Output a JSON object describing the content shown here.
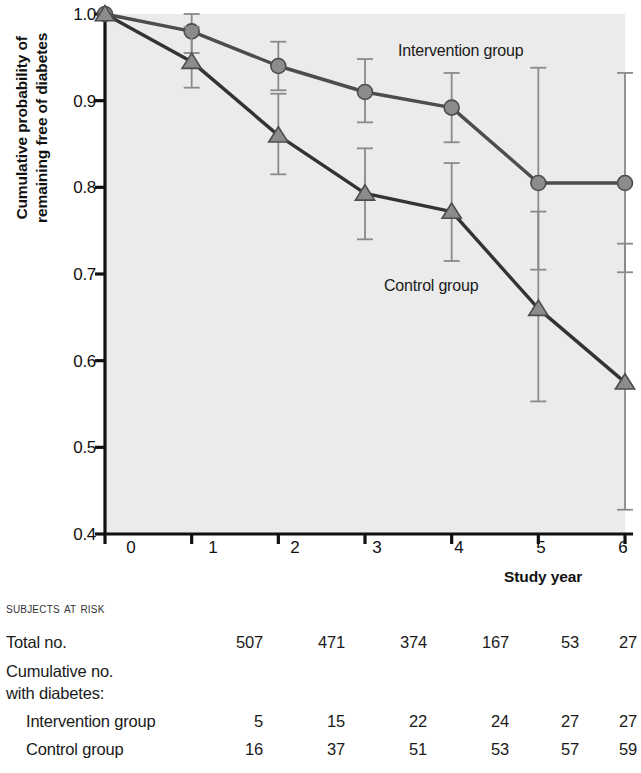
{
  "chart_data": {
    "type": "line",
    "title": "",
    "xlabel": "Study year",
    "ylabel": "Cumulative probability of remaining free of diabetes",
    "x": [
      0,
      1,
      2,
      3,
      4,
      5,
      6
    ],
    "xlim": [
      0,
      6
    ],
    "ylim": [
      0.4,
      1.0
    ],
    "xticks": [
      "0",
      "1",
      "2",
      "3",
      "4",
      "5",
      "6"
    ],
    "yticks": [
      "1.0",
      "0.9",
      "0.8",
      "0.7",
      "0.6",
      "0.5",
      "0.4"
    ],
    "grid": false,
    "legend_position": "inline-annotations",
    "plot_background": "#ebebeb",
    "series": [
      {
        "name": "Intervention group",
        "marker": "circle",
        "color": "#8c8c8c",
        "line_color": "#4d4d4d",
        "values": [
          1.0,
          0.98,
          0.94,
          0.91,
          0.892,
          0.805,
          0.805
        ],
        "err_low": [
          1.0,
          0.955,
          0.912,
          0.875,
          0.852,
          0.705,
          0.702
        ],
        "err_high": [
          1.0,
          1.0,
          0.968,
          0.948,
          0.932,
          0.938,
          0.932
        ]
      },
      {
        "name": "Control group",
        "marker": "triangle",
        "color": "#8c8c8c",
        "line_color": "#333333",
        "values": [
          1.0,
          0.945,
          0.86,
          0.793,
          0.772,
          0.66,
          0.575
        ],
        "err_low": [
          1.0,
          0.915,
          0.815,
          0.74,
          0.715,
          0.553,
          0.428
        ],
        "err_high": [
          1.0,
          0.985,
          0.908,
          0.845,
          0.828,
          0.772,
          0.735
        ]
      }
    ],
    "annotations": [
      {
        "text": "Intervention group",
        "x": 3.45,
        "y": 0.965
      },
      {
        "text": "Control group",
        "x": 3.15,
        "y": 0.715
      }
    ]
  },
  "risk_table": {
    "heading": "Subjects at Risk",
    "column_years": [
      "0",
      "1",
      "2",
      "3",
      "4",
      "5",
      "6"
    ],
    "rows": [
      {
        "label": "Total no.",
        "indent": false,
        "values": [
          "507",
          "471",
          "374",
          "167",
          "53",
          "27"
        ]
      },
      {
        "label": "Cumulative no.",
        "indent": false,
        "values": []
      },
      {
        "label": "with diabetes:",
        "indent": false,
        "values": []
      },
      {
        "label": "Intervention group",
        "indent": true,
        "values": [
          "5",
          "15",
          "22",
          "24",
          "27",
          "27"
        ]
      },
      {
        "label": "Control group",
        "indent": true,
        "values": [
          "16",
          "37",
          "51",
          "53",
          "57",
          "59"
        ]
      }
    ]
  }
}
